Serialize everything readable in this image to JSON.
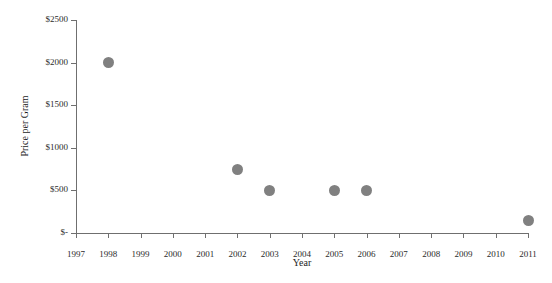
{
  "chart_data": {
    "type": "scatter",
    "title": "",
    "xlabel": "Year",
    "ylabel": "Price per Gram",
    "xlim": [
      1997,
      2011
    ],
    "ylim": [
      0,
      2500
    ],
    "grid": false,
    "legend": null,
    "x_tick_labels": [
      "1997",
      "1998",
      "1999",
      "2000",
      "2001",
      "2002",
      "2003",
      "2004",
      "2005",
      "2006",
      "2007",
      "2008",
      "2009",
      "2010",
      "2011"
    ],
    "y_tick_labels": [
      "$-",
      "$500",
      "$1000",
      "$1500",
      "$2000",
      "$2500"
    ],
    "y_tick_values": [
      0,
      500,
      1000,
      1500,
      2000,
      2500
    ],
    "series": [
      {
        "name": "Price per Gram",
        "marker": "circle",
        "color": "#808080",
        "points": [
          {
            "x": 1998,
            "y": 2000
          },
          {
            "x": 2002,
            "y": 750
          },
          {
            "x": 2003,
            "y": 500
          },
          {
            "x": 2005,
            "y": 500
          },
          {
            "x": 2006,
            "y": 500
          },
          {
            "x": 2011,
            "y": 150
          }
        ]
      }
    ]
  },
  "colors": {
    "marker": "#808080",
    "axis": "#6f6f6f",
    "text": "#2b2b2b",
    "background": "#ffffff"
  }
}
